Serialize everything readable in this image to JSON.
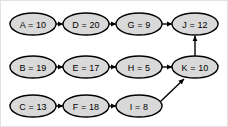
{
  "diagram": {
    "type": "directed-graph",
    "background_color": "#ffffff",
    "border_color": "#e2e2e2",
    "node_fill_color": "#d9d9d9",
    "node_stroke_color": "#000000",
    "edge_color": "#000000",
    "nodes": [
      {
        "id": "A",
        "label": "A = 10",
        "name": "A",
        "value": 10,
        "cx": 32,
        "cy": 23,
        "rx": 23,
        "ry": 11
      },
      {
        "id": "D",
        "label": "D = 20",
        "name": "D",
        "value": 20,
        "cx": 85,
        "cy": 23,
        "rx": 23,
        "ry": 11
      },
      {
        "id": "G",
        "label": "G = 9",
        "name": "G",
        "value": 9,
        "cx": 138,
        "cy": 23,
        "rx": 23,
        "ry": 11
      },
      {
        "id": "J",
        "label": "J = 12",
        "name": "J",
        "value": 12,
        "cx": 194,
        "cy": 23,
        "rx": 23,
        "ry": 11
      },
      {
        "id": "B",
        "label": "B = 19",
        "name": "B",
        "value": 19,
        "cx": 32,
        "cy": 66,
        "rx": 23,
        "ry": 11
      },
      {
        "id": "E",
        "label": "E = 17",
        "name": "E",
        "value": 17,
        "cx": 85,
        "cy": 66,
        "rx": 23,
        "ry": 11
      },
      {
        "id": "H",
        "label": "H = 5",
        "name": "H",
        "value": 5,
        "cx": 138,
        "cy": 66,
        "rx": 23,
        "ry": 11
      },
      {
        "id": "K",
        "label": "K = 10",
        "name": "K",
        "value": 10,
        "cx": 194,
        "cy": 66,
        "rx": 23,
        "ry": 11
      },
      {
        "id": "C",
        "label": "C = 13",
        "name": "C",
        "value": 13,
        "cx": 32,
        "cy": 105,
        "rx": 23,
        "ry": 11
      },
      {
        "id": "F",
        "label": "F = 18",
        "name": "F",
        "value": 18,
        "cx": 85,
        "cy": 105,
        "rx": 23,
        "ry": 11
      },
      {
        "id": "I",
        "label": "I = 8",
        "name": "I",
        "value": 8,
        "cx": 138,
        "cy": 105,
        "rx": 23,
        "ry": 11
      }
    ],
    "edges": [
      {
        "from": "A",
        "to": "D",
        "x1": 55,
        "y1": 23,
        "x2": 62,
        "y2": 23,
        "arrowhead": true
      },
      {
        "from": "D",
        "to": "G",
        "x1": 108,
        "y1": 23,
        "x2": 115,
        "y2": 23,
        "arrowhead": true
      },
      {
        "from": "G",
        "to": "J",
        "x1": 161,
        "y1": 23,
        "x2": 171,
        "y2": 23,
        "arrowhead": true
      },
      {
        "from": "B",
        "to": "E",
        "x1": 55,
        "y1": 66,
        "x2": 62,
        "y2": 66,
        "arrowhead": true
      },
      {
        "from": "E",
        "to": "H",
        "x1": 108,
        "y1": 66,
        "x2": 115,
        "y2": 66,
        "arrowhead": true
      },
      {
        "from": "H",
        "to": "K",
        "x1": 161,
        "y1": 66,
        "x2": 171,
        "y2": 66,
        "arrowhead": true
      },
      {
        "from": "C",
        "to": "F",
        "x1": 55,
        "y1": 105,
        "x2": 62,
        "y2": 105,
        "arrowhead": true
      },
      {
        "from": "F",
        "to": "I",
        "x1": 108,
        "y1": 105,
        "x2": 115,
        "y2": 105,
        "arrowhead": true
      },
      {
        "from": "K",
        "to": "J",
        "x1": 194,
        "y1": 55,
        "x2": 194,
        "y2": 35,
        "arrowhead": true
      },
      {
        "from": "I",
        "to": "K",
        "x1": 159,
        "y1": 101,
        "x2": 183,
        "y2": 78,
        "arrowhead": true
      }
    ]
  }
}
